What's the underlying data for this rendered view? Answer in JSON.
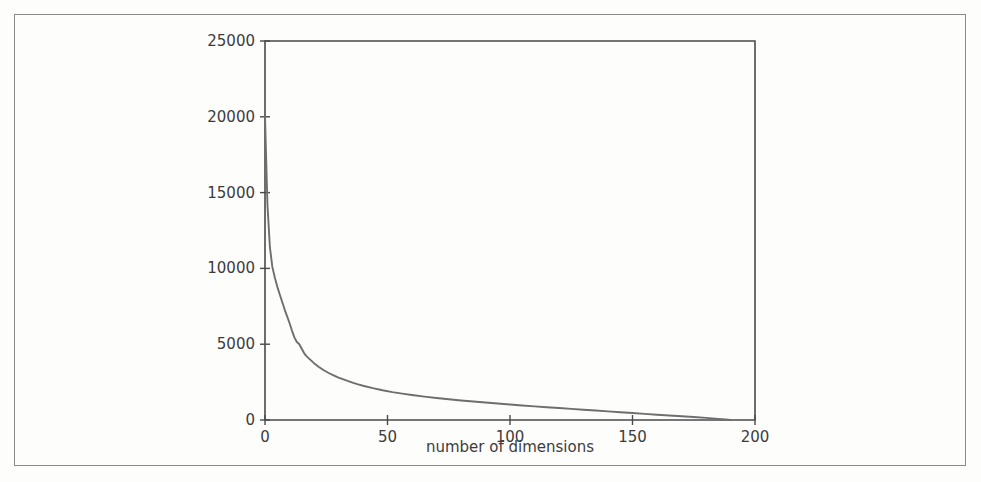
{
  "figure": {
    "background_color": "#fdfdfc",
    "page_border_color": "#8a8a8a",
    "axis_color": "#4a4a4a",
    "curve_color": "#6e6e6e"
  },
  "chart_data": {
    "type": "line",
    "title": "",
    "subtitle": "",
    "xlabel": "number of dimensions",
    "ylabel": "",
    "xlim": [
      0,
      200
    ],
    "ylim": [
      0,
      25000
    ],
    "xticks": [
      0,
      50,
      100,
      150,
      200
    ],
    "xtick_labels": [
      "0",
      "50",
      "100",
      "150",
      "200"
    ],
    "yticks": [
      0,
      5000,
      10000,
      15000,
      20000,
      25000
    ],
    "ytick_labels": [
      "0",
      "5000",
      "10000",
      "15000",
      "20000",
      "25000"
    ],
    "grid": false,
    "legend": null,
    "legend_position": "none",
    "annotations": [],
    "series": [
      {
        "name": "eigenvalue",
        "x": [
          0,
          1,
          2,
          3,
          4,
          5,
          6,
          7,
          8,
          9,
          10,
          11,
          12,
          13,
          14,
          15,
          16,
          17,
          18,
          19,
          20,
          22,
          24,
          26,
          28,
          30,
          32,
          34,
          36,
          38,
          40,
          44,
          48,
          52,
          56,
          60,
          65,
          70,
          75,
          80,
          85,
          90,
          95,
          100,
          105,
          110,
          115,
          120,
          125,
          130,
          135,
          140,
          145,
          150,
          155,
          160,
          165,
          170,
          175,
          180,
          185,
          188,
          190
        ],
        "values": [
          20000,
          14200,
          11400,
          10100,
          9400,
          8800,
          8300,
          7800,
          7300,
          6850,
          6400,
          5900,
          5450,
          5150,
          5000,
          4700,
          4400,
          4200,
          4050,
          3900,
          3750,
          3500,
          3280,
          3100,
          2950,
          2800,
          2680,
          2560,
          2450,
          2350,
          2260,
          2100,
          1960,
          1840,
          1740,
          1650,
          1545,
          1450,
          1370,
          1290,
          1220,
          1150,
          1085,
          1020,
          960,
          900,
          845,
          790,
          735,
          680,
          625,
          570,
          515,
          460,
          405,
          350,
          300,
          250,
          195,
          140,
          75,
          35,
          5
        ]
      }
    ]
  },
  "axis_labels": {
    "x_title": "number of dimensions"
  }
}
